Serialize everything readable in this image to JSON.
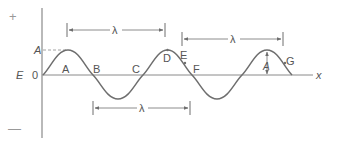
{
  "diagram": {
    "colors": {
      "axis": "#8a8a8a",
      "wave": "#6e6e6e",
      "text": "#555555",
      "sign": "#999999",
      "dashed": "#8a8a8a"
    },
    "axes": {
      "y_label": "E",
      "origin_label": "0",
      "x_label": "x",
      "plus_sign": "+",
      "minus_sign": "—"
    },
    "amplitude": {
      "axis_marker_label": "A",
      "arrow_label": "A"
    },
    "points": [
      {
        "id": "A",
        "label": "A"
      },
      {
        "id": "B",
        "label": "B"
      },
      {
        "id": "C",
        "label": "C"
      },
      {
        "id": "D",
        "label": "D"
      },
      {
        "id": "E",
        "label": "E"
      },
      {
        "id": "F",
        "label": "F"
      },
      {
        "id": "G",
        "label": "G"
      }
    ],
    "wavelength_markers": [
      {
        "id": "top",
        "label": "λ",
        "from": "crest 1",
        "to": "crest 2"
      },
      {
        "id": "right",
        "label": "λ",
        "from": "point E",
        "to": "equivalent point past crest 3"
      },
      {
        "id": "bottom",
        "label": "λ",
        "from": "point B",
        "to": "point F"
      }
    ]
  }
}
